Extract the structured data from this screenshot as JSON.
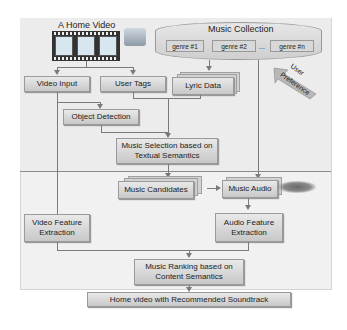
{
  "diagram": {
    "title_video": "A Home Video",
    "music_collection": {
      "title": "Music Collection",
      "genres": [
        "genre #1",
        "genre #2",
        "genre #n"
      ],
      "ellipsis": "..."
    },
    "user_preference": {
      "line1": "User",
      "line2": "Preference"
    },
    "nodes": {
      "video_input": "Video Input",
      "user_tags": "User  Tags",
      "lyric_data": "Lyric Data",
      "object_detection": "Object Detection",
      "music_selection_1": "Music Selection based on",
      "music_selection_2": "Textual Semantics",
      "music_candidates": "Music Candidates",
      "music_audio": "Music Audio",
      "video_feature_1": "Video Feature",
      "video_feature_2": "Extraction",
      "audio_feature_1": "Audio Feature",
      "audio_feature_2": "Extraction",
      "music_ranking_1": "Music Ranking based on",
      "music_ranking_2": "Content Semantics",
      "output": "Home video with Recommended Soundtrack"
    },
    "edges": [
      [
        "A Home Video",
        "Video Input"
      ],
      [
        "A Home Video",
        "User Tags"
      ],
      [
        "Video Input",
        "Object Detection"
      ],
      [
        "Music Collection",
        "Lyric Data"
      ],
      [
        "User Tags",
        "Music Selection based on Textual Semantics"
      ],
      [
        "Lyric Data",
        "Music Selection based on Textual Semantics"
      ],
      [
        "Object Detection",
        "Music Selection based on Textual Semantics"
      ],
      [
        "Music Selection based on Textual Semantics",
        "Music Candidates"
      ],
      [
        "Music Candidates",
        "Music Audio"
      ],
      [
        "Music Collection",
        "Music Audio"
      ],
      [
        "User Preference",
        "Music Collection"
      ],
      [
        "Video Input",
        "Video Feature Extraction"
      ],
      [
        "Music Audio",
        "Audio Feature Extraction"
      ],
      [
        "Video Feature Extraction",
        "Music Ranking based on Content Semantics"
      ],
      [
        "Audio Feature Extraction",
        "Music Ranking based on Content Semantics"
      ],
      [
        "Music Ranking based on Content Semantics",
        "Home video with Recommended Soundtrack"
      ]
    ]
  }
}
